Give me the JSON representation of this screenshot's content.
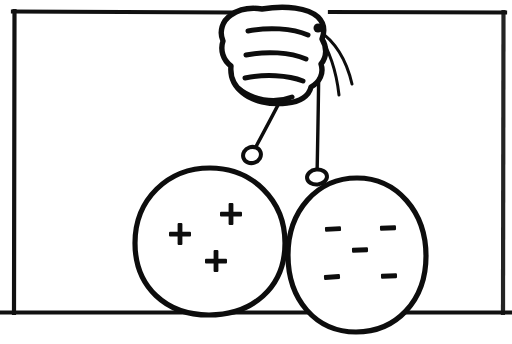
{
  "figure": {
    "title": "Hand holding two charged balls on strings",
    "background_color": "#ffffff",
    "ink_color": "#0d0d0d",
    "width": 512,
    "height": 344,
    "style": "hand-drawn line art, black ink on white"
  },
  "frame": {
    "name": "rectangular border",
    "left": 13,
    "top": 11,
    "right": 505,
    "bottom": 313,
    "stroke_width": 4.2,
    "bottom_line_extends_beyond_frame": true,
    "bottom_line_x_start": 0,
    "bottom_line_x_end": 512
  },
  "hand": {
    "name": "closed fist",
    "description": "A closed fist seen from the side, gripping strings between thumb and fingers",
    "bounds": {
      "x": 222,
      "y": 6,
      "width": 110,
      "height": 100
    },
    "finger_crease_count": 3,
    "grip_point": {
      "x": 318,
      "y": 28
    }
  },
  "strings": [
    {
      "name": "left string",
      "from": {
        "x": 318,
        "y": 28
      },
      "to": {
        "x": 252,
        "y": 155
      },
      "attached_ball": "left"
    },
    {
      "name": "right string",
      "from": {
        "x": 318,
        "y": 28
      },
      "to": {
        "x": 317,
        "y": 176
      },
      "attached_ball": "right"
    }
  ],
  "loose_string_ends": [
    {
      "name": "wisp-outer",
      "from": {
        "x": 318,
        "y": 30
      },
      "to": {
        "x": 351,
        "y": 84
      }
    },
    {
      "name": "wisp-inner",
      "from": {
        "x": 318,
        "y": 32
      },
      "to": {
        "x": 339,
        "y": 95
      }
    }
  ],
  "balls": [
    {
      "id": "left",
      "name": "positively charged ball",
      "charge_sign": "+",
      "charge_label": "positive",
      "charge_count": 3,
      "center": {
        "x": 209,
        "y": 241
      },
      "radius_x": 75,
      "radius_y": 74,
      "knot": {
        "x": 252,
        "y": 155
      },
      "charge_positions": [
        {
          "x": 180,
          "y": 234
        },
        {
          "x": 231,
          "y": 214
        },
        {
          "x": 216,
          "y": 261
        }
      ]
    },
    {
      "id": "right",
      "name": "negatively charged ball",
      "charge_sign": "−",
      "charge_label": "negative",
      "charge_count": 5,
      "center": {
        "x": 357,
        "y": 255
      },
      "radius_x": 69,
      "radius_y": 77,
      "knot": {
        "x": 317,
        "y": 178
      },
      "charge_positions": [
        {
          "x": 333,
          "y": 229
        },
        {
          "x": 388,
          "y": 228
        },
        {
          "x": 360,
          "y": 250
        },
        {
          "x": 332,
          "y": 277
        },
        {
          "x": 389,
          "y": 276
        }
      ]
    }
  ],
  "charge_glyph": {
    "plus_arm_length": 11,
    "plus_thickness": 4.5,
    "minus_length": 15,
    "minus_thickness": 4.5
  }
}
